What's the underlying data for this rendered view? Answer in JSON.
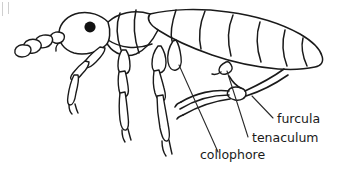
{
  "figure": {
    "background_color": "#ffffff",
    "ink_color": "#1a1a1a",
    "label_color": "#1a1a1a",
    "eye_color": "#111111"
  },
  "labels": {
    "furcula": "furcula",
    "tenaculum": "tenaculum",
    "collophore": "collophore"
  },
  "label_positions": {
    "furcula": {
      "x": 277,
      "y": 123
    },
    "tenaculum": {
      "x": 252,
      "y": 142
    },
    "collophore": {
      "x": 200,
      "y": 159
    }
  },
  "anatomy_parts": [
    "head",
    "antenna",
    "eye",
    "thorax",
    "abdomen",
    "foreleg",
    "midleg",
    "hindleg",
    "collophore",
    "tenaculum",
    "furcula"
  ]
}
